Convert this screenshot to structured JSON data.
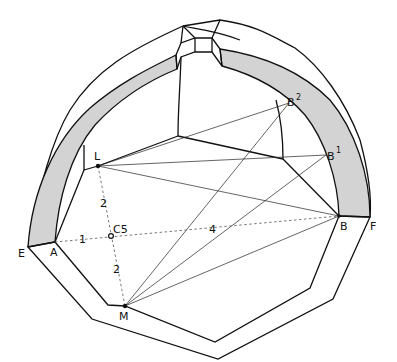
{
  "figure": {
    "colors": {
      "line": "#111111",
      "band_fill": "#d3d3d3",
      "construction_line": "#555555",
      "background": "#ffffff"
    }
  },
  "points": {
    "E": {
      "label": "E"
    },
    "A": {
      "label": "A"
    },
    "B": {
      "label": "B"
    },
    "F": {
      "label": "F"
    },
    "L": {
      "label": "L"
    },
    "M": {
      "label": "M"
    },
    "C5": {
      "label": "C5"
    },
    "B1": {
      "label": "B",
      "superscript": "1"
    },
    "B2": {
      "label": "B",
      "superscript": "2"
    }
  },
  "measurements": {
    "L_to_C5": "2",
    "C5_to_M": "2",
    "A_to_C5": "1",
    "C5_to_B": "4"
  }
}
